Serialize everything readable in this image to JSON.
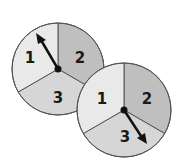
{
  "figure": {
    "colors": {
      "section_1": "#e9e9e9",
      "section_2": "#bfbfbf",
      "section_3": "#d6d6d6",
      "outline": "#555555",
      "arrow": "#111111"
    },
    "spinners": [
      {
        "name": "spinner-left",
        "labels": {
          "s1": "1",
          "s2": "2",
          "s3": "3"
        },
        "arrow_points_to": "1"
      },
      {
        "name": "spinner-right",
        "labels": {
          "s1": "1",
          "s2": "2",
          "s3": "3"
        },
        "arrow_points_to": "3"
      }
    ]
  }
}
